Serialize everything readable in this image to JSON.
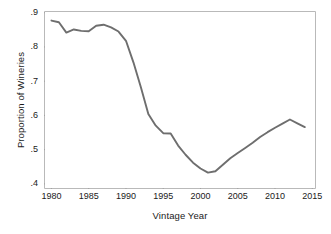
{
  "chart_data": {
    "type": "line",
    "title": "",
    "xlabel": "Vintage Year",
    "ylabel": "Proportion of Wineries",
    "xlim": [
      1979.0,
      2015.5
    ],
    "ylim": [
      0.385,
      0.905
    ],
    "xticks": [
      1980,
      1985,
      1990,
      1995,
      2000,
      2005,
      2010,
      2015
    ],
    "xticklabels": [
      "1980",
      "1985",
      "1990",
      "1995",
      "2000",
      "2005",
      "2010",
      "2015"
    ],
    "yticks": [
      0.4,
      0.5,
      0.6,
      0.7,
      0.8,
      0.9
    ],
    "yticklabels": [
      ".4",
      ".5",
      ".6",
      ".7",
      ".8",
      ".9"
    ],
    "grid": false,
    "legend": null,
    "series": [
      {
        "name": "Proportion of Wineries",
        "color": "#6e6e6e",
        "x": [
          1980,
          1981,
          1982,
          1983,
          1984,
          1985,
          1986,
          1987,
          1988,
          1989,
          1990,
          1991,
          1992,
          1993,
          1994,
          1995,
          1996,
          1997,
          1998,
          1999,
          2000,
          2001,
          2002,
          2003,
          2004,
          2005,
          2006,
          2007,
          2008,
          2009,
          2010,
          2011,
          2012,
          2013,
          2014
        ],
        "values": [
          0.877,
          0.872,
          0.842,
          0.851,
          0.847,
          0.846,
          0.862,
          0.865,
          0.857,
          0.845,
          0.818,
          0.755,
          0.682,
          0.604,
          0.57,
          0.548,
          0.547,
          0.512,
          0.485,
          0.462,
          0.445,
          0.433,
          0.437,
          0.456,
          0.475,
          0.49,
          0.505,
          0.52,
          0.537,
          0.551,
          0.564,
          0.576,
          0.588,
          0.577,
          0.566
        ]
      }
    ],
    "annotations": []
  },
  "colors": {
    "line": "#6e6e6e",
    "frame": "#b9b9b9",
    "text": "#1a1a1a",
    "background": "#ffffff"
  }
}
